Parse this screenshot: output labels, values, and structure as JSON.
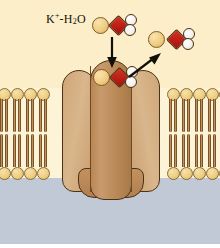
{
  "figure": {
    "label": {
      "species": "K",
      "charge": "+",
      "dash": "-",
      "water_h": "H",
      "water_sub": "2",
      "water_o": "O",
      "full_text": "K+-H2O"
    },
    "regions": [
      {
        "name": "extracellular-space",
        "color": "#fceec8"
      },
      {
        "name": "lipid-bilayer",
        "color": "#fdf3d6"
      },
      {
        "name": "cytoplasm",
        "color": "#c2c9d6"
      }
    ],
    "colors": {
      "extracellular": "#fceec8",
      "cytoplasm": "#c2c9d6",
      "bilayer_background": "#fdf3d6",
      "lipid_head": "#edcf86",
      "lipid_head_outline": "#8a6a35",
      "lipid_tail": "#b0804e",
      "protein_lobe": "#d0a87a",
      "protein_pore": "#bb8a58",
      "protein_outline": "#4a3118",
      "potassium_ion": "#f0cd84",
      "oxygen": "#c32218",
      "hydrogen": "#ffffff",
      "arrow": "#120f0a"
    },
    "molecules": [
      {
        "name": "hydrated-k-top",
        "k_label": "K+",
        "water_label": "H2O",
        "position": "top-center"
      },
      {
        "name": "hydrated-k-channel-mouth",
        "k_label": "K+",
        "water_label": "H2O",
        "position": "channel-mouth"
      },
      {
        "name": "hydrated-k-released",
        "k_label": "K+",
        "water_label": "H2O",
        "position": "upper-right"
      }
    ],
    "arrows": [
      {
        "name": "arrow-influx-down",
        "direction": "down",
        "meaning": "ion approaches channel"
      },
      {
        "name": "arrow-release-up-right",
        "direction": "up-right",
        "meaning": "ion released"
      }
    ],
    "protein": {
      "name": "ion-channel-protein",
      "lobes": 2,
      "pore": "central-pore"
    },
    "bilayer": {
      "upper_leaflet_lipid_count": 16,
      "lower_leaflet_lipid_count": 16,
      "lipid_spacing_px": 13
    }
  }
}
